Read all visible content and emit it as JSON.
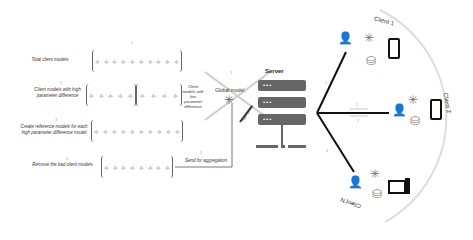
{
  "steps": [
    {
      "num": "1",
      "label": "Total client models"
    },
    {
      "num": "2",
      "label": "Client models with high parameter difference"
    },
    {
      "num": "3",
      "label": "Create reference models for each high parameter difference model"
    },
    {
      "num": "4",
      "label": "Remove the bad client models"
    },
    {
      "num": "5",
      "label": "Send for aggregation"
    },
    {
      "num": "6",
      "label": "Aggregation"
    }
  ],
  "low_diff_label": "Client models with low parameter difference",
  "global_model": {
    "num": "1",
    "label": "Global model"
  },
  "server": {
    "title": "Server",
    "dots": "•••"
  },
  "clients": [
    {
      "label": "Client 1"
    },
    {
      "label": "Client 2"
    },
    {
      "label": "Client N"
    }
  ],
  "link_numbers": [
    "1",
    "2",
    "3"
  ],
  "icons": {
    "user": "👤",
    "model": "✳",
    "database": "⛁",
    "phone": "▯",
    "desktop": "🖥",
    "node": "⟡"
  }
}
